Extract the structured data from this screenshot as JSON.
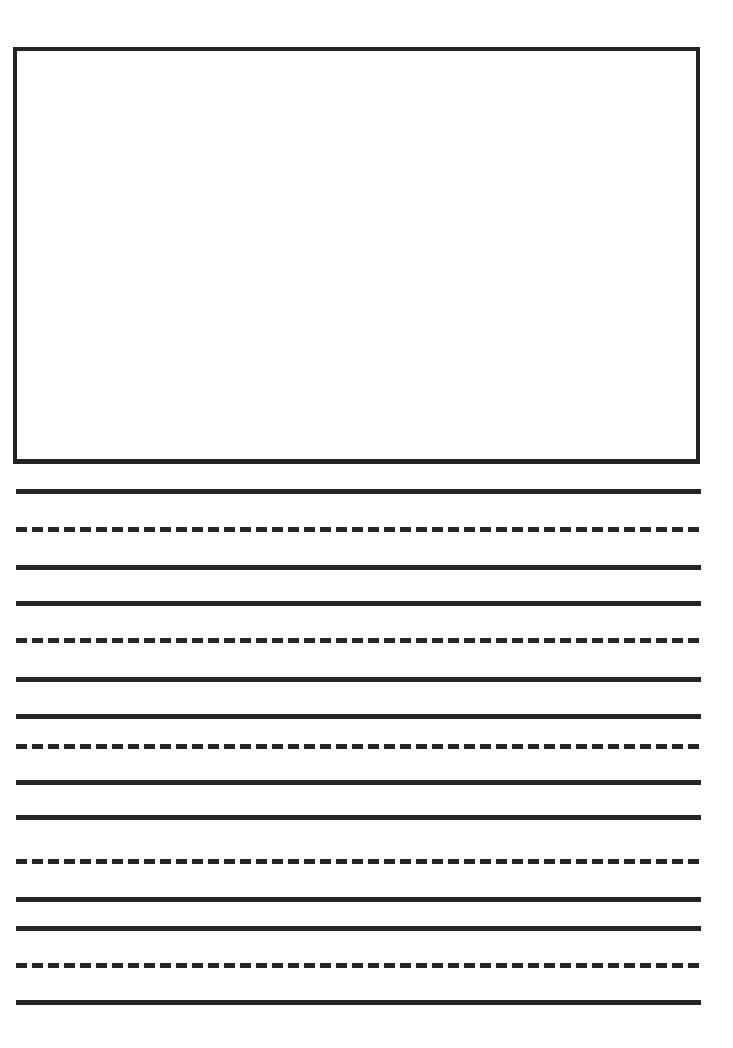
{
  "page": {
    "kind": "handwriting-practice-worksheet",
    "width": 733,
    "height": 1048,
    "background_color": "#ffffff",
    "ink_color": "#262626"
  },
  "drawing_box": {
    "label": "",
    "x": 13,
    "y": 47,
    "width": 687,
    "height": 417,
    "border_width": 4,
    "border_color": "#242424",
    "fill_color": "#ffffff"
  },
  "writing_lines": {
    "left": 16,
    "right": 701,
    "thickness": 5,
    "solid_color": "#262626",
    "dash_length": 11,
    "dash_gap": 5,
    "items": [
      {
        "style": "solid",
        "y": 489
      },
      {
        "style": "dashed",
        "y": 527
      },
      {
        "style": "solid",
        "y": 565
      },
      {
        "style": "solid",
        "y": 601
      },
      {
        "style": "dashed",
        "y": 638
      },
      {
        "style": "solid",
        "y": 677
      },
      {
        "style": "solid",
        "y": 714
      },
      {
        "style": "dashed",
        "y": 744
      },
      {
        "style": "solid",
        "y": 780
      },
      {
        "style": "solid",
        "y": 815
      },
      {
        "style": "dashed",
        "y": 859
      },
      {
        "style": "solid",
        "y": 897
      },
      {
        "style": "solid",
        "y": 926
      },
      {
        "style": "dashed",
        "y": 963
      },
      {
        "style": "solid",
        "y": 1000
      }
    ]
  }
}
